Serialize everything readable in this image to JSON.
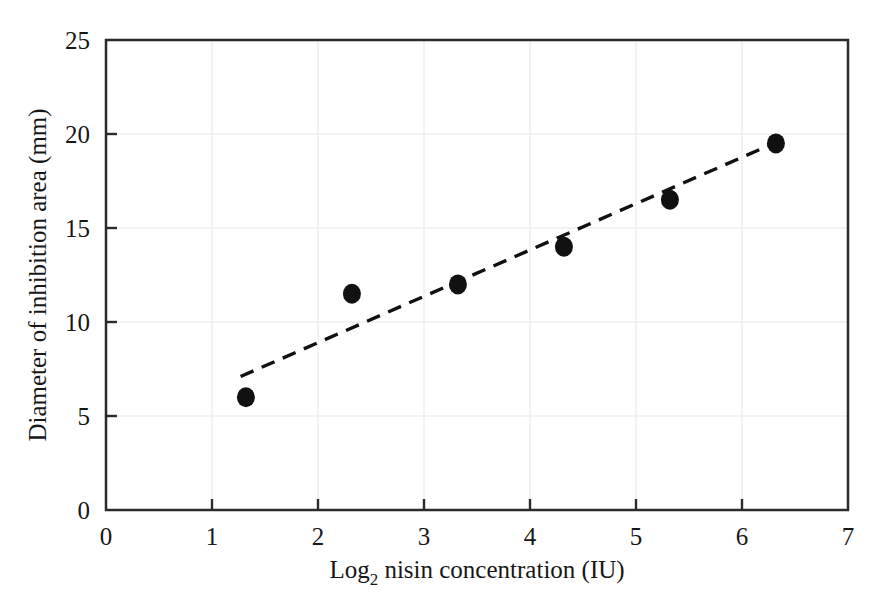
{
  "chart_data": {
    "type": "scatter",
    "title": "",
    "xlabel": "Log2 nisin concentration (IU)",
    "xlabel_main": "Log",
    "xlabel_sub": "2",
    "xlabel_rest": " nisin concentration (IU)",
    "ylabel": "Diameter of inhibition area (mm)",
    "xlim": [
      0,
      7
    ],
    "ylim": [
      0,
      25
    ],
    "xticks": [
      0,
      1,
      2,
      3,
      4,
      5,
      6,
      7
    ],
    "yticks": [
      0,
      5,
      10,
      15,
      20,
      25
    ],
    "xtick_labels": [
      "0",
      "1",
      "2",
      "3",
      "4",
      "5",
      "6",
      "7"
    ],
    "ytick_labels": [
      "0",
      "5",
      "10",
      "15",
      "20",
      "25"
    ],
    "grid": true,
    "grid_color": "#f0eeee",
    "legend": false,
    "legend_position": "none",
    "marker_color": "#111111",
    "marker_shape": "circle",
    "marker_size": 9,
    "series": [
      {
        "name": "Inhibition zone diameter",
        "x": [
          1.32,
          2.32,
          3.32,
          4.32,
          5.32,
          6.32
        ],
        "values": [
          6.0,
          11.5,
          12.0,
          14.0,
          16.5,
          19.5
        ]
      }
    ],
    "trendline": {
      "style": "dashed",
      "color": "#111111",
      "x_start": 1.27,
      "y_start": 7.1,
      "x_end": 6.34,
      "y_end": 19.6
    }
  },
  "axes": {
    "frame_color": "#2b2b2b",
    "tick_color": "#2b2b2b"
  }
}
